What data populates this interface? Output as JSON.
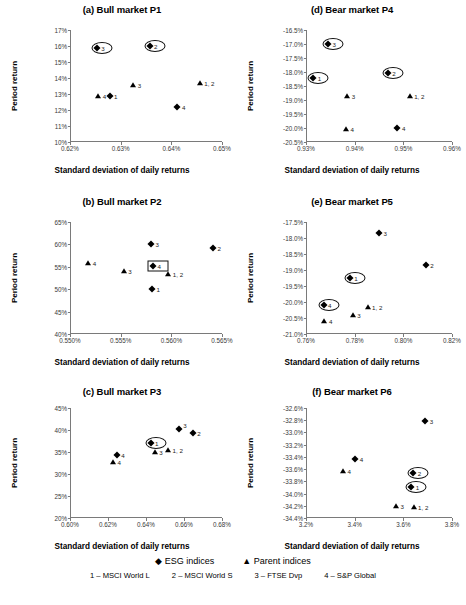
{
  "figure": {
    "axis_titles": {
      "x": "Standard deviation of daily returns",
      "y": "Period return"
    }
  },
  "legend": {
    "markers": [
      {
        "glyph": "◆",
        "label": "ESG indices"
      },
      {
        "glyph": "▲",
        "label": "Parent indices"
      }
    ],
    "keys": [
      "1 – MSCI World L",
      "2 – MSCI World S",
      "3 – FTSE Dvp",
      "4 – S&P Global"
    ]
  },
  "chart_data": [
    {
      "id": "a",
      "type": "scatter",
      "title": "(a) Bull market P1",
      "xlabel": "Standard deviation of daily returns",
      "ylabel": "Period return",
      "xlim": [
        0.62,
        0.65
      ],
      "ylim": [
        10,
        17
      ],
      "xticks": [
        "0.62%",
        "0.63%",
        "0.64%",
        "0.65%"
      ],
      "xtickvals": [
        0.62,
        0.63,
        0.64,
        0.65
      ],
      "yticks": [
        "10%",
        "11%",
        "12%",
        "13%",
        "14%",
        "15%",
        "16%",
        "17%"
      ],
      "ytickvals": [
        10,
        11,
        12,
        13,
        14,
        15,
        16,
        17
      ],
      "grid": false,
      "series": [
        {
          "name": "ESG indices",
          "marker": "diamond",
          "points": [
            {
              "label": "3",
              "x": 0.6253,
              "y": 15.85,
              "lpos": "right",
              "highlight": "ellipse"
            },
            {
              "label": "2",
              "x": 0.6357,
              "y": 16.0,
              "lpos": "right",
              "highlight": "ellipse"
            },
            {
              "label": "1",
              "x": 0.6278,
              "y": 12.85,
              "lpos": "right"
            },
            {
              "label": "4",
              "x": 0.6412,
              "y": 12.2,
              "lpos": "right"
            }
          ]
        },
        {
          "name": "Parent indices",
          "marker": "triangle",
          "points": [
            {
              "label": "4",
              "x": 0.6256,
              "y": 12.85,
              "lpos": "right"
            },
            {
              "label": "3",
              "x": 0.6325,
              "y": 13.55,
              "lpos": "right"
            },
            {
              "label": "1, 2",
              "x": 0.6456,
              "y": 13.7,
              "lpos": "right"
            }
          ]
        }
      ]
    },
    {
      "id": "b",
      "type": "scatter",
      "title": "(b) Bull market P2",
      "xlabel": "Standard deviation of daily returns",
      "ylabel": "Period return",
      "xlim": [
        0.55,
        0.565
      ],
      "ylim": [
        40,
        65
      ],
      "xticks": [
        "0.550%",
        "0.555%",
        "0.560%",
        "0.565%"
      ],
      "xtickvals": [
        0.55,
        0.555,
        0.56,
        0.565
      ],
      "yticks": [
        "40%",
        "45%",
        "50%",
        "55%",
        "60%",
        "65%"
      ],
      "ytickvals": [
        40,
        45,
        50,
        55,
        60,
        65
      ],
      "grid": false,
      "series": [
        {
          "name": "ESG indices",
          "marker": "diamond",
          "points": [
            {
              "label": "3",
              "x": 0.558,
              "y": 60.1,
              "lpos": "right"
            },
            {
              "label": "2",
              "x": 0.5641,
              "y": 59.2,
              "lpos": "right"
            },
            {
              "label": "4",
              "x": 0.5582,
              "y": 55.2,
              "lpos": "right",
              "highlight": "rect"
            },
            {
              "label": "1",
              "x": 0.5581,
              "y": 50.0,
              "lpos": "right"
            }
          ]
        },
        {
          "name": "Parent indices",
          "marker": "triangle",
          "points": [
            {
              "label": "4",
              "x": 0.5518,
              "y": 55.9,
              "lpos": "right"
            },
            {
              "label": "3",
              "x": 0.5553,
              "y": 54.1,
              "lpos": "right"
            },
            {
              "label": "1, 2",
              "x": 0.5597,
              "y": 53.3,
              "lpos": "right"
            }
          ]
        }
      ]
    },
    {
      "id": "c",
      "type": "scatter",
      "title": "(c) Bull market P3",
      "xlabel": "Standard deviation of daily returns",
      "ylabel": "Period return",
      "xlim": [
        0.6,
        0.68
      ],
      "ylim": [
        20,
        45
      ],
      "xticks": [
        "0.60%",
        "0.62%",
        "0.64%",
        "0.66%",
        "0.68%"
      ],
      "xtickvals": [
        0.6,
        0.62,
        0.64,
        0.66,
        0.68
      ],
      "yticks": [
        "20%",
        "25%",
        "30%",
        "35%",
        "40%",
        "45%"
      ],
      "ytickvals": [
        20,
        25,
        30,
        35,
        40,
        45
      ],
      "grid": false,
      "series": [
        {
          "name": "ESG indices",
          "marker": "diamond",
          "points": [
            {
              "label": "3",
              "x": 0.6573,
              "y": 40.2,
              "lpos": "upright"
            },
            {
              "label": "2",
              "x": 0.6646,
              "y": 39.4,
              "lpos": "right"
            },
            {
              "label": "1",
              "x": 0.6424,
              "y": 37.1,
              "lpos": "right",
              "highlight": "ellipse"
            },
            {
              "label": "4",
              "x": 0.6246,
              "y": 34.4,
              "lpos": "right"
            }
          ]
        },
        {
          "name": "Parent indices",
          "marker": "triangle",
          "points": [
            {
              "label": "4",
              "x": 0.6226,
              "y": 32.8,
              "lpos": "right"
            },
            {
              "label": "3",
              "x": 0.6446,
              "y": 35.0,
              "lpos": "right"
            },
            {
              "label": "1, 2",
              "x": 0.6516,
              "y": 35.4,
              "lpos": "right"
            }
          ]
        }
      ]
    },
    {
      "id": "d",
      "type": "scatter",
      "title": "(d) Bear market P4",
      "xlabel": "Standard deviation of daily returns",
      "ylabel": "Period return",
      "xlim": [
        0.93,
        0.96
      ],
      "ylim": [
        -20.5,
        -16.5
      ],
      "xticks": [
        "0.93%",
        "0.94%",
        "0.95%",
        "0.96%"
      ],
      "xtickvals": [
        0.93,
        0.94,
        0.95,
        0.96
      ],
      "yticks": [
        "-16.5%",
        "-17.0%",
        "-17.5%",
        "-18.0%",
        "-18.5%",
        "-19.0%",
        "-19.5%",
        "-20.0%",
        "-20.5%"
      ],
      "ytickvals": [
        -16.5,
        -17.0,
        -17.5,
        -18.0,
        -18.5,
        -19.0,
        -19.5,
        -20.0,
        -20.5
      ],
      "grid": false,
      "series": [
        {
          "name": "ESG indices",
          "marker": "diamond",
          "points": [
            {
              "label": "3",
              "x": 0.9345,
              "y": -17.0,
              "lpos": "right",
              "highlight": "ellipse"
            },
            {
              "label": "1",
              "x": 0.9315,
              "y": -18.2,
              "lpos": "right",
              "highlight": "ellipse"
            },
            {
              "label": "2",
              "x": 0.9468,
              "y": -18.05,
              "lpos": "right",
              "highlight": "ellipse"
            },
            {
              "label": "4",
              "x": 0.9488,
              "y": -20.0,
              "lpos": "right"
            }
          ]
        },
        {
          "name": "Parent indices",
          "marker": "triangle",
          "points": [
            {
              "label": "3",
              "x": 0.9385,
              "y": -18.85,
              "lpos": "right"
            },
            {
              "label": "1, 2",
              "x": 0.9513,
              "y": -18.85,
              "lpos": "right"
            },
            {
              "label": "4",
              "x": 0.9382,
              "y": -20.05,
              "lpos": "right"
            }
          ]
        }
      ]
    },
    {
      "id": "e",
      "type": "scatter",
      "title": "(e) Bear market P5",
      "xlabel": "Standard deviation of daily returns",
      "ylabel": "Period return",
      "xlim": [
        0.76,
        0.82
      ],
      "ylim": [
        -21.0,
        -17.5
      ],
      "xticks": [
        "0.76%",
        "0.78%",
        "0.80%",
        "0.82%"
      ],
      "xtickvals": [
        0.76,
        0.78,
        0.8,
        0.82
      ],
      "yticks": [
        "-17.5%",
        "-18.0%",
        "-18.5%",
        "-19.0%",
        "-19.5%",
        "-20.0%",
        "-20.5%",
        "-21.0%"
      ],
      "ytickvals": [
        -17.5,
        -18.0,
        -18.5,
        -19.0,
        -19.5,
        -20.0,
        -20.5,
        -21.0
      ],
      "grid": false,
      "series": [
        {
          "name": "ESG indices",
          "marker": "diamond",
          "points": [
            {
              "label": "3",
              "x": 0.79,
              "y": -17.85,
              "lpos": "right"
            },
            {
              "label": "2",
              "x": 0.8092,
              "y": -18.85,
              "lpos": "right"
            },
            {
              "label": "1",
              "x": 0.778,
              "y": -19.25,
              "lpos": "right",
              "highlight": "ellipse"
            },
            {
              "label": "4",
              "x": 0.7672,
              "y": -20.1,
              "lpos": "right",
              "highlight": "ellipse"
            }
          ]
        },
        {
          "name": "Parent indices",
          "marker": "triangle",
          "points": [
            {
              "label": "1, 2",
              "x": 0.7853,
              "y": -20.15,
              "lpos": "right"
            },
            {
              "label": "3",
              "x": 0.7792,
              "y": -20.4,
              "lpos": "right"
            },
            {
              "label": "4",
              "x": 0.7676,
              "y": -20.6,
              "lpos": "right"
            }
          ]
        }
      ]
    },
    {
      "id": "f",
      "type": "scatter",
      "title": "(f) Bear market P6",
      "xlabel": "Standard deviation of daily returns",
      "ylabel": "Period return",
      "xlim": [
        3.2,
        3.8
      ],
      "ylim": [
        -34.4,
        -32.6
      ],
      "xticks": [
        "3.2%",
        "3.4%",
        "3.6%",
        "3.8%"
      ],
      "xtickvals": [
        3.2,
        3.4,
        3.6,
        3.8
      ],
      "yticks": [
        "-32.6%",
        "-32.8%",
        "-33.0%",
        "-33.2%",
        "-33.4%",
        "-33.6%",
        "-33.8%",
        "-34.0%",
        "-34.2%",
        "-34.4%"
      ],
      "ytickvals": [
        -32.6,
        -32.8,
        -33.0,
        -33.2,
        -33.4,
        -33.6,
        -33.8,
        -34.0,
        -34.2,
        -34.4
      ],
      "grid": false,
      "series": [
        {
          "name": "ESG indices",
          "marker": "diamond",
          "points": [
            {
              "label": "3",
              "x": 3.69,
              "y": -32.82,
              "lpos": "right"
            },
            {
              "label": "4",
              "x": 3.402,
              "y": -33.44,
              "lpos": "right"
            },
            {
              "label": "2",
              "x": 3.641,
              "y": -33.66,
              "lpos": "right",
              "highlight": "ellipse"
            },
            {
              "label": "1",
              "x": 3.633,
              "y": -33.9,
              "lpos": "right",
              "highlight": "ellipse"
            }
          ]
        },
        {
          "name": "Parent indices",
          "marker": "triangle",
          "points": [
            {
              "label": "4",
              "x": 3.352,
              "y": -33.63,
              "lpos": "right"
            },
            {
              "label": "3",
              "x": 3.57,
              "y": -34.21,
              "lpos": "right"
            },
            {
              "label": "1, 2",
              "x": 3.642,
              "y": -34.22,
              "lpos": "right"
            }
          ]
        }
      ]
    }
  ]
}
